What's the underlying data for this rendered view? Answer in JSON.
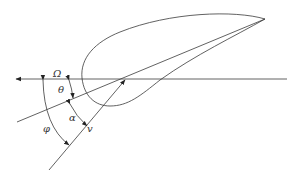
{
  "diagram": {
    "colors": {
      "stroke": "#3a3a3a",
      "text": "#333333",
      "background": "#ffffff"
    },
    "labels": {
      "omega": "Ω",
      "theta": "θ",
      "alpha": "α",
      "phi": "φ",
      "velocity": "v"
    },
    "elements": [
      {
        "id": "airfoil-profile",
        "type": "closed-curve",
        "description": "airfoil cross-section"
      },
      {
        "id": "rotation-axis-line",
        "type": "arrow",
        "label": "Ω",
        "direction": "left"
      },
      {
        "id": "chord-line",
        "type": "line"
      },
      {
        "id": "velocity-vector",
        "type": "arrow",
        "label": "v"
      },
      {
        "id": "theta-arc",
        "type": "angle-arc",
        "label": "θ",
        "between": [
          "rotation-axis-line",
          "chord-line"
        ]
      },
      {
        "id": "alpha-arc",
        "type": "angle-arc",
        "label": "α",
        "between": [
          "chord-line",
          "velocity-vector"
        ]
      },
      {
        "id": "phi-arc",
        "type": "angle-arc",
        "label": "φ",
        "between": [
          "rotation-axis-line",
          "velocity-vector"
        ]
      }
    ]
  }
}
